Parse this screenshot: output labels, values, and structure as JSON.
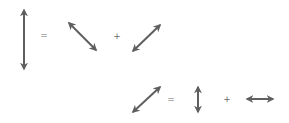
{
  "colors": {
    "arrow": "#5f5f5f",
    "symbol": "#6a6a6a",
    "background": "#ffffff"
  },
  "equations": [
    {
      "lhs": "vertical-double-arrow",
      "operator_equals": "=",
      "term1": "diagonal-down-right-double-arrow",
      "operator_plus": "+",
      "term2": "diagonal-up-right-double-arrow"
    },
    {
      "lhs": "diagonal-up-right-double-arrow",
      "operator_equals": "=",
      "term1": "vertical-double-arrow",
      "operator_plus": "+",
      "term2": "horizontal-double-arrow"
    }
  ]
}
